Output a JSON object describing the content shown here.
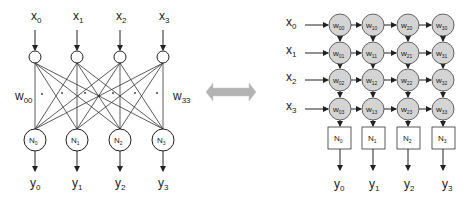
{
  "left_network": {
    "inputs": [
      "x",
      "x",
      "x",
      "x"
    ],
    "input_subs": [
      "0",
      "1",
      "2",
      "3"
    ],
    "neurons": [
      "N",
      "N",
      "N",
      "N"
    ],
    "neuron_subs": [
      "0",
      "1",
      "2",
      "3"
    ],
    "outputs": [
      "y",
      "y",
      "y",
      "y"
    ],
    "output_subs": [
      "0",
      "1",
      "2",
      "3"
    ],
    "weight_first": "w",
    "weight_first_sub": "00",
    "weight_last": "w",
    "weight_last_sub": "33"
  },
  "equivalence_arrow": {
    "icon": "double-headed-arrow-icon",
    "color": "#b3b3b3"
  },
  "systolic_array": {
    "inputs": [
      "x",
      "x",
      "x",
      "x"
    ],
    "input_subs": [
      "0",
      "1",
      "2",
      "3"
    ],
    "cells": [
      [
        "00",
        "10",
        "20",
        "30"
      ],
      [
        "01",
        "11",
        "21",
        "31"
      ],
      [
        "02",
        "12",
        "22",
        "32"
      ],
      [
        "03",
        "13",
        "23",
        "33"
      ]
    ],
    "cell_letter": "w",
    "cell_fill": "#d4d4d4",
    "neurons": [
      "N",
      "N",
      "N",
      "N"
    ],
    "neuron_subs": [
      "0",
      "1",
      "2",
      "3"
    ],
    "outputs": [
      "y",
      "y",
      "y",
      "y"
    ],
    "output_subs": [
      "0",
      "1",
      "2",
      "3"
    ]
  }
}
